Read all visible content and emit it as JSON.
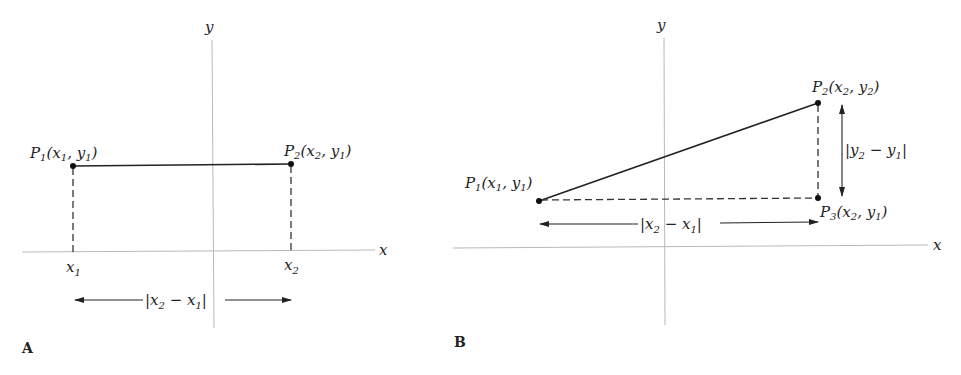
{
  "figure": {
    "panelA": {
      "panel_label": "A",
      "axis_x_label": "x",
      "axis_y_label": "y",
      "p1": {
        "name": "P",
        "sub": "1",
        "coords_open": "(x",
        "c1sub": "1",
        "sep": ", y",
        "c2sub": "1",
        "close": ")"
      },
      "p2": {
        "name": "P",
        "sub": "2",
        "coords_open": "(x",
        "c1sub": "2",
        "sep": ", y",
        "c2sub": "1",
        "close": ")"
      },
      "tick_x1": {
        "base": "x",
        "sub": "1"
      },
      "tick_x2": {
        "base": "x",
        "sub": "2"
      },
      "distance": {
        "open": "|x",
        "s1": "2",
        "mid": " − x",
        "s2": "1",
        "close": "|"
      }
    },
    "panelB": {
      "panel_label": "B",
      "axis_x_label": "x",
      "axis_y_label": "y",
      "p1": {
        "name": "P",
        "sub": "1",
        "coords_open": "(x",
        "c1sub": "1",
        "sep": ", y",
        "c2sub": "1",
        "close": ")"
      },
      "p2": {
        "name": "P",
        "sub": "2",
        "coords_open": "(x",
        "c1sub": "2",
        "sep": ", y",
        "c2sub": "2",
        "close": ")"
      },
      "p3": {
        "name": "P",
        "sub": "3",
        "coords_open": "(x",
        "c1sub": "2",
        "sep": ", y",
        "c2sub": "1",
        "close": ")"
      },
      "dx": {
        "open": "|x",
        "s1": "2",
        "mid": " − x",
        "s2": "1",
        "close": "|"
      },
      "dy": {
        "open": "|y",
        "s1": "2",
        "mid": " − y",
        "s2": "1",
        "close": "|"
      }
    }
  }
}
